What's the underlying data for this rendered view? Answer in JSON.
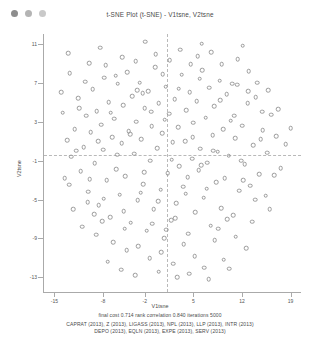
{
  "window": {
    "title": "t-SNE Plot (t-SNE) - V1tsne, V2tsne",
    "traffic_lights": [
      "close",
      "minimize",
      "zoom"
    ]
  },
  "caption": {
    "stats": "final cost  0.714  rank correlation  0.840  iterations  5000",
    "tickers_line1": "CAPRAT (2013), Z (2013), LIGASS (2013), NPL (2013), LLP (2013), INTR (2013)",
    "tickers_line2": "DEPO (2013), EQLN (2013), EXPE (2013), SERV (2013)"
  },
  "chart_data": {
    "type": "scatter",
    "title": "t-SNE Plot (t-SNE) - V1tsne, V2tsne",
    "xlabel": "V1tsne",
    "ylabel": "V2tsne",
    "xlim": [
      -16.5,
      20.5
    ],
    "ylim": [
      -14.5,
      12.0
    ],
    "xticks": [
      -15,
      -8,
      -2,
      5,
      12,
      19
    ],
    "yticks": [
      11,
      7,
      3,
      -1,
      -5,
      -9,
      -13
    ],
    "grid": false,
    "legend": null,
    "marker": {
      "shape": "open-circle",
      "color": "#9a9a9a",
      "size": 2.6
    },
    "guides": {
      "hline_y": -0.4,
      "vline_x": 1.2,
      "style": "dashed",
      "color": "#b9b9b9"
    },
    "series": [
      {
        "name": "observations",
        "points": [
          [
            -13.2,
            1.1
          ],
          [
            -12.6,
            -0.6
          ],
          [
            -12.1,
            2.2
          ],
          [
            -11.6,
            5.4
          ],
          [
            -11.2,
            -2.1
          ],
          [
            -10.8,
            0.4
          ],
          [
            -10.4,
            3.6
          ],
          [
            -10.1,
            -4.2
          ],
          [
            -9.8,
            1.9
          ],
          [
            -9.5,
            6.3
          ],
          [
            -9.2,
            -1.3
          ],
          [
            -8.9,
            4.1
          ],
          [
            -8.6,
            -5.6
          ],
          [
            -8.3,
            2.7
          ],
          [
            -8.0,
            0.1
          ],
          [
            -7.8,
            7.5
          ],
          [
            -7.5,
            -3.0
          ],
          [
            -7.2,
            5.0
          ],
          [
            -7.0,
            -6.8
          ],
          [
            -6.7,
            1.4
          ],
          [
            -6.4,
            3.3
          ],
          [
            -6.1,
            -1.9
          ],
          [
            -5.9,
            6.9
          ],
          [
            -5.6,
            -4.5
          ],
          [
            -5.3,
            0.8
          ],
          [
            -5.1,
            4.7
          ],
          [
            -4.8,
            -2.6
          ],
          [
            -4.5,
            8.1
          ],
          [
            -4.3,
            2.0
          ],
          [
            -4.0,
            -7.4
          ],
          [
            -3.8,
            5.6
          ],
          [
            -3.5,
            -0.3
          ],
          [
            -3.2,
            3.0
          ],
          [
            -3.0,
            -5.1
          ],
          [
            -2.7,
            7.0
          ],
          [
            -2.5,
            1.2
          ],
          [
            -2.2,
            -3.4
          ],
          [
            -2.0,
            4.4
          ],
          [
            -1.7,
            -8.2
          ],
          [
            -1.5,
            6.1
          ],
          [
            -1.2,
            -1.0
          ],
          [
            -1.0,
            2.5
          ],
          [
            -0.7,
            -6.0
          ],
          [
            -0.5,
            8.6
          ],
          [
            -0.2,
            0.3
          ],
          [
            0.0,
            4.9
          ],
          [
            0.3,
            -4.0
          ],
          [
            0.5,
            1.8
          ],
          [
            0.8,
            -9.0
          ],
          [
            1.0,
            6.6
          ],
          [
            1.3,
            -2.3
          ],
          [
            1.5,
            3.8
          ],
          [
            1.8,
            -7.1
          ],
          [
            2.0,
            0.9
          ],
          [
            2.3,
            5.3
          ],
          [
            2.5,
            -5.4
          ],
          [
            2.8,
            2.4
          ],
          [
            3.0,
            -1.6
          ],
          [
            3.3,
            7.8
          ],
          [
            3.5,
            -3.7
          ],
          [
            3.8,
            1.0
          ],
          [
            4.0,
            4.2
          ],
          [
            4.3,
            -8.5
          ],
          [
            4.5,
            6.0
          ],
          [
            4.8,
            -0.8
          ],
          [
            5.0,
            2.9
          ],
          [
            5.3,
            -6.3
          ],
          [
            5.5,
            5.1
          ],
          [
            5.8,
            -2.0
          ],
          [
            6.0,
            0.2
          ],
          [
            6.3,
            8.3
          ],
          [
            6.5,
            -4.8
          ],
          [
            6.8,
            3.4
          ],
          [
            7.0,
            -1.2
          ],
          [
            7.3,
            6.5
          ],
          [
            7.5,
            -7.7
          ],
          [
            7.8,
            1.6
          ],
          [
            8.0,
            4.6
          ],
          [
            8.3,
            -3.2
          ],
          [
            8.5,
            -0.1
          ],
          [
            8.8,
            7.2
          ],
          [
            9.0,
            -5.9
          ],
          [
            9.3,
            2.2
          ],
          [
            9.5,
            -2.8
          ],
          [
            9.8,
            5.8
          ],
          [
            10.1,
            -0.5
          ],
          [
            10.4,
            3.1
          ],
          [
            10.7,
            -6.6
          ],
          [
            11.0,
            1.3
          ],
          [
            11.3,
            6.8
          ],
          [
            11.6,
            -4.1
          ],
          [
            12.0,
            2.6
          ],
          [
            12.4,
            -1.4
          ],
          [
            12.8,
            4.9
          ],
          [
            13.2,
            -3.6
          ],
          [
            13.6,
            0.6
          ],
          [
            14.0,
            5.5
          ],
          [
            14.5,
            -2.4
          ],
          [
            15.0,
            2.1
          ],
          [
            15.6,
            -0.2
          ],
          [
            16.2,
            3.7
          ],
          [
            16.9,
            1.5
          ],
          [
            17.6,
            -1.8
          ],
          [
            18.3,
            0.7
          ],
          [
            19.0,
            2.3
          ],
          [
            -13.8,
            3.9
          ],
          [
            -12.9,
            -3.5
          ],
          [
            -11.9,
            0.0
          ],
          [
            -10.6,
            7.1
          ],
          [
            -9.9,
            -2.9
          ],
          [
            -8.7,
            1.0
          ],
          [
            -7.9,
            -4.9
          ],
          [
            -6.9,
            3.9
          ],
          [
            -6.0,
            -0.4
          ],
          [
            -5.0,
            -6.2
          ],
          [
            -4.1,
            1.7
          ],
          [
            -3.1,
            6.2
          ],
          [
            -2.1,
            -2.2
          ],
          [
            -1.1,
            4.0
          ],
          [
            -0.1,
            -5.2
          ],
          [
            0.9,
            3.2
          ],
          [
            1.9,
            -0.9
          ],
          [
            2.9,
            6.4
          ],
          [
            3.9,
            -4.4
          ],
          [
            4.9,
            1.4
          ],
          [
            5.9,
            7.4
          ],
          [
            6.9,
            -3.9
          ],
          [
            7.9,
            0.0
          ],
          [
            8.9,
            5.2
          ],
          [
            9.9,
            -7.0
          ],
          [
            10.9,
            3.6
          ],
          [
            11.9,
            -1.0
          ],
          [
            12.9,
            6.1
          ],
          [
            13.9,
            -5.0
          ],
          [
            14.9,
            4.0
          ],
          [
            -11.0,
            -7.8
          ],
          [
            -9.0,
            -8.6
          ],
          [
            -6.5,
            -9.4
          ],
          [
            -4.6,
            -10.2
          ],
          [
            -2.9,
            -9.8
          ],
          [
            -1.3,
            -11.0
          ],
          [
            0.4,
            -10.4
          ],
          [
            2.1,
            -11.6
          ],
          [
            3.6,
            -9.6
          ],
          [
            5.2,
            -10.8
          ],
          [
            6.6,
            -12.0
          ],
          [
            8.1,
            -9.2
          ],
          [
            9.4,
            -11.2
          ],
          [
            11.1,
            -8.8
          ],
          [
            12.6,
            -10.0
          ],
          [
            -7.3,
            -11.4
          ],
          [
            -5.4,
            -12.2
          ],
          [
            -3.4,
            -12.8
          ],
          [
            0.0,
            -12.4
          ],
          [
            2.7,
            -13.0
          ],
          [
            4.4,
            -12.6
          ],
          [
            7.2,
            -13.2
          ],
          [
            10.2,
            -12.1
          ],
          [
            -0.9,
            -7.5
          ],
          [
            1.1,
            -8.1
          ],
          [
            -12.3,
            -6.0
          ],
          [
            -10.2,
            -5.3
          ],
          [
            -8.1,
            -7.2
          ],
          [
            -2.6,
            -4.3
          ],
          [
            4.2,
            -2.7
          ],
          [
            6.1,
            -1.5
          ],
          [
            13.5,
            -7.3
          ],
          [
            15.4,
            -4.6
          ],
          [
            16.6,
            -2.5
          ],
          [
            17.2,
            4.3
          ],
          [
            -12.8,
            8.0
          ],
          [
            -10.0,
            9.0
          ],
          [
            -7.6,
            8.8
          ],
          [
            -5.2,
            9.6
          ],
          [
            -3.3,
            9.2
          ],
          [
            -0.4,
            9.9
          ],
          [
            1.6,
            9.3
          ],
          [
            3.1,
            10.4
          ],
          [
            5.6,
            9.7
          ],
          [
            7.6,
            10.1
          ],
          [
            9.1,
            8.9
          ],
          [
            11.4,
            9.4
          ],
          [
            13.0,
            8.2
          ],
          [
            14.2,
            7.0
          ],
          [
            15.8,
            6.2
          ],
          [
            -14.0,
            6.0
          ],
          [
            -13.5,
            -2.8
          ],
          [
            -11.4,
            4.4
          ],
          [
            -9.3,
            -6.5
          ],
          [
            -6.2,
            7.7
          ],
          [
            -4.9,
            -8.0
          ],
          [
            -2.3,
            5.9
          ],
          [
            0.6,
            7.9
          ],
          [
            2.4,
            -6.9
          ],
          [
            4.6,
            8.9
          ],
          [
            8.6,
            -8.0
          ],
          [
            10.6,
            6.9
          ],
          [
            12.2,
            -3.0
          ],
          [
            14.7,
            1.2
          ],
          [
            16.0,
            -6.0
          ],
          [
            -13.0,
            10.0
          ],
          [
            -8.4,
            10.6
          ],
          [
            -1.9,
            11.2
          ],
          [
            6.2,
            11.0
          ],
          [
            12.1,
            10.8
          ]
        ]
      }
    ]
  }
}
